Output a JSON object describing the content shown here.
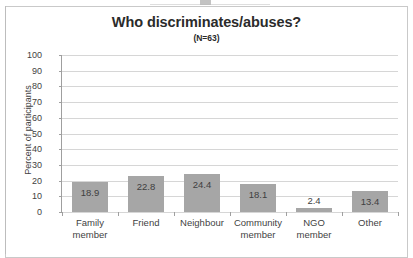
{
  "chart_data": {
    "type": "bar",
    "title": "Who discriminates/abuses?",
    "subtitle": "(N=63)",
    "xlabel": "",
    "ylabel": "Percent of participants",
    "ylim": [
      0,
      100
    ],
    "ytick_step": 10,
    "yticks": [
      "100",
      "90",
      "80",
      "70",
      "60",
      "50",
      "40",
      "30",
      "20",
      "10",
      "0"
    ],
    "grid": true,
    "legend": "none",
    "bar_color": "#a6a6a6",
    "categories": [
      "Family member",
      "Friend",
      "Neighbour",
      "Community member",
      "NGO member",
      "Other"
    ],
    "category_lines": [
      [
        "Family",
        "member"
      ],
      [
        "Friend",
        ""
      ],
      [
        "Neighbour",
        ""
      ],
      [
        "Community",
        "member"
      ],
      [
        "NGO",
        "member"
      ],
      [
        "Other",
        ""
      ]
    ],
    "values": [
      18.9,
      22.8,
      24.4,
      18.1,
      2.4,
      13.4
    ],
    "data_labels": [
      "18.9",
      "22.8",
      "24.4",
      "18.1",
      "2.4",
      "13.4"
    ]
  }
}
